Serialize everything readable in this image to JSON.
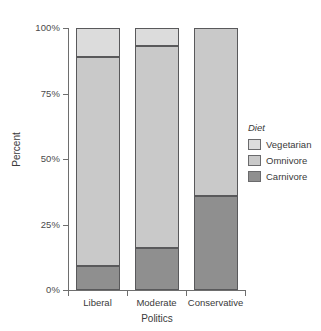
{
  "chart_data": {
    "type": "bar",
    "stacked": true,
    "orientation": "vertical",
    "title": "",
    "xlabel": "Politics",
    "ylabel": "Percent",
    "categories": [
      "Liberal",
      "Moderate",
      "Conservative"
    ],
    "ylim": [
      0,
      100
    ],
    "ytick_values": [
      0,
      25,
      50,
      75,
      100
    ],
    "ytick_labels": [
      "0%",
      "25%",
      "50%",
      "75%",
      "100%"
    ],
    "grid": false,
    "legend_position": "right",
    "legend_title": "Diet",
    "series": [
      {
        "name": "Carnivore",
        "color": "#8f8f8f",
        "values": [
          9,
          16,
          36
        ]
      },
      {
        "name": "Omnivore",
        "color": "#c9c9c9",
        "values": [
          80,
          77,
          64
        ]
      },
      {
        "name": "Vegetarian",
        "color": "#dcdcdc",
        "values": [
          11,
          7,
          0
        ]
      }
    ],
    "stack_order_bottom_to_top": [
      "Carnivore",
      "Omnivore",
      "Vegetarian"
    ]
  },
  "axes": {
    "y_title": "Percent",
    "x_title": "Politics",
    "y_ticks": [
      {
        "label": "100%",
        "value": 100
      },
      {
        "label": "75%",
        "value": 75
      },
      {
        "label": "50%",
        "value": 50
      },
      {
        "label": "25%",
        "value": 25
      },
      {
        "label": "0%",
        "value": 0
      }
    ],
    "x_ticks": [
      {
        "label": "Liberal"
      },
      {
        "label": "Moderate"
      },
      {
        "label": "Conservative"
      }
    ]
  },
  "legend": {
    "title": "Diet",
    "entries": [
      {
        "label": "Vegetarian",
        "color": "#dcdcdc"
      },
      {
        "label": "Omnivore",
        "color": "#c9c9c9"
      },
      {
        "label": "Carnivore",
        "color": "#8f8f8f"
      }
    ]
  },
  "colors": {
    "axis": "#6e6e6e",
    "bar_outline": "#59595b",
    "text": "#3a3a3a",
    "background": "#ffffff"
  }
}
